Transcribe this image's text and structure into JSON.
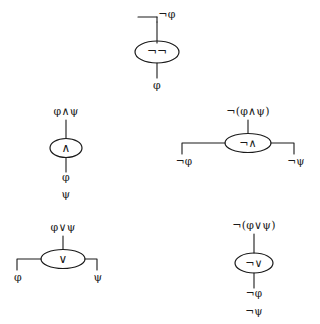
{
  "figure": {
    "ink_color": "#1a1a1a",
    "background_color": "#ffffff",
    "symbols": {
      "not": "¬",
      "and": "∧",
      "or": "∨",
      "phi": "φ",
      "psi": "ψ"
    }
  },
  "diagrams": [
    {
      "id": "negation",
      "name": "negation-gate",
      "gate_symbol": "¬",
      "top_label": "¬φ",
      "bottom_labels": [
        "φ"
      ],
      "input_count": 1,
      "wire_style": "vertical",
      "has_left_stub": true
    },
    {
      "id": "conjunction",
      "name": "conjunction-gate",
      "gate_symbol": "∧",
      "top_label": "φ∧ψ",
      "bottom_labels": [
        "φ",
        "ψ"
      ],
      "input_count": 2,
      "wire_style": "stacked",
      "has_left_stub": false
    },
    {
      "id": "nand",
      "name": "nand-gate",
      "gate_symbol": "¬∧",
      "top_label": "¬(φ∧ψ)",
      "bottom_labels": [
        "¬φ",
        "¬ψ"
      ],
      "input_count": 2,
      "wire_style": "split",
      "has_left_stub": false
    },
    {
      "id": "disjunction",
      "name": "disjunction-gate",
      "gate_symbol": "∨",
      "top_label": "φ∨ψ",
      "bottom_labels": [
        "φ",
        "ψ"
      ],
      "input_count": 2,
      "wire_style": "split",
      "has_left_stub": false
    },
    {
      "id": "nor",
      "name": "nor-gate",
      "gate_symbol": "¬∨",
      "top_label": "¬(φ∨ψ)",
      "bottom_labels": [
        "¬φ",
        "¬ψ"
      ],
      "input_count": 2,
      "wire_style": "stacked",
      "has_left_stub": false
    }
  ]
}
